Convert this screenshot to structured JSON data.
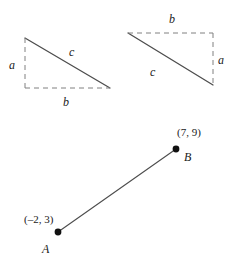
{
  "figure": {
    "background_color": "#ffffff",
    "stroke_color": "#4d4d4d",
    "dash_color": "#808080",
    "text_color": "#1a1a1a",
    "point_color": "#111111",
    "panels": [
      {
        "id": "left-triangle",
        "description": "right triangle with hypotenuse from upper-left to lower-right, dashed legs",
        "labels": {
          "leg_vertical": "a",
          "leg_horizontal": "b",
          "hypotenuse": "c"
        }
      },
      {
        "id": "right-triangle",
        "description": "right triangle with hypotenuse from upper-left to lower-right, dashed legs on top and right",
        "labels": {
          "leg_vertical": "a",
          "leg_horizontal": "b",
          "hypotenuse": "c"
        }
      },
      {
        "id": "segment-ab",
        "description": "line segment joining point A to point B on the coordinate plane",
        "points": [
          {
            "name": "A",
            "coordinates": "(–2, 3)",
            "x": -2,
            "y": 3
          },
          {
            "name": "B",
            "coordinates": "(7, 9)",
            "x": 7,
            "y": 9
          }
        ]
      }
    ]
  }
}
